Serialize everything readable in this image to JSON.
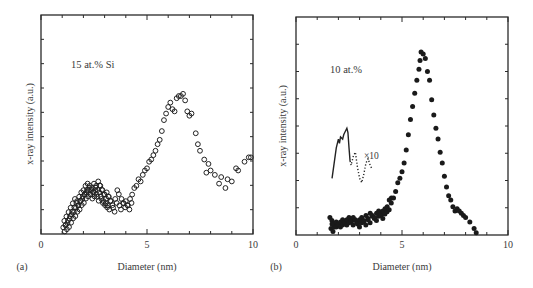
{
  "chart_data": [
    {
      "panel": "(a)",
      "type": "scatter",
      "annotation": "15 at.% Si",
      "xlabel": "Diameter (nm)",
      "ylabel": "x-ray intensity (a.u.)",
      "xlim": [
        0,
        10
      ],
      "ylim": [
        0,
        1
      ],
      "xticks": [
        0,
        5,
        10
      ],
      "marker": "open-circle",
      "grid": false,
      "series": [
        {
          "name": "15 at.% Si",
          "x": [
            1.05,
            1.1,
            1.15,
            1.2,
            1.25,
            1.3,
            1.35,
            1.4,
            1.45,
            1.5,
            1.55,
            1.6,
            1.65,
            1.7,
            1.75,
            1.8,
            1.85,
            1.9,
            1.95,
            2.0,
            2.05,
            2.1,
            2.15,
            2.2,
            2.25,
            2.3,
            2.35,
            2.4,
            2.45,
            2.5,
            2.55,
            2.6,
            2.65,
            2.7,
            2.75,
            2.8,
            2.85,
            2.9,
            2.95,
            3.0,
            3.05,
            3.1,
            3.15,
            3.2,
            3.3,
            3.4,
            3.5,
            3.6,
            3.7,
            3.8,
            3.9,
            4.0,
            4.1,
            4.2,
            4.3,
            4.4,
            4.5,
            4.6,
            4.7,
            4.8,
            4.9,
            5.0,
            5.1,
            5.2,
            5.3,
            5.4,
            5.5,
            5.6,
            5.7,
            5.8,
            5.9,
            6.0,
            6.1,
            6.2,
            6.3,
            6.4,
            6.5,
            6.6,
            6.7,
            6.8,
            6.9,
            7.0,
            7.1,
            7.3,
            7.4,
            7.5,
            7.7,
            7.8,
            7.9,
            8.0,
            8.2,
            8.4,
            8.5,
            8.7,
            8.8,
            9.0,
            9.2,
            9.3,
            9.6,
            9.8,
            9.9
          ],
          "y": [
            0.03,
            0.06,
            0.04,
            0.08,
            0.05,
            0.1,
            0.07,
            0.12,
            0.09,
            0.14,
            0.1,
            0.16,
            0.12,
            0.15,
            0.13,
            0.17,
            0.15,
            0.19,
            0.16,
            0.2,
            0.18,
            0.22,
            0.19,
            0.23,
            0.2,
            0.22,
            0.18,
            0.21,
            0.19,
            0.23,
            0.2,
            0.22,
            0.17,
            0.24,
            0.19,
            0.22,
            0.16,
            0.2,
            0.15,
            0.18,
            0.14,
            0.19,
            0.13,
            0.17,
            0.15,
            0.12,
            0.16,
            0.2,
            0.13,
            0.16,
            0.14,
            0.15,
            0.13,
            0.16,
            0.18,
            0.21,
            0.22,
            0.25,
            0.24,
            0.27,
            0.29,
            0.3,
            0.33,
            0.34,
            0.36,
            0.38,
            0.41,
            0.43,
            0.47,
            0.52,
            0.55,
            0.58,
            0.6,
            0.57,
            0.56,
            0.62,
            0.63,
            0.63,
            0.64,
            0.61,
            0.56,
            0.54,
            0.55,
            0.46,
            0.41,
            0.38,
            0.34,
            0.28,
            0.32,
            0.29,
            0.27,
            0.23,
            0.26,
            0.21,
            0.25,
            0.24,
            0.3,
            0.29,
            0.33,
            0.35,
            0.35
          ]
        }
      ]
    },
    {
      "panel": "(b)",
      "type": "scatter",
      "annotation": "10 at.%",
      "inset_annotation": "×10",
      "xlabel": "Diameter (nm)",
      "ylabel": "x-ray intensity (a.u.)",
      "xlim": [
        0,
        10
      ],
      "ylim": [
        0,
        1
      ],
      "xticks": [
        0,
        5,
        10
      ],
      "marker": "filled-circle",
      "grid": false,
      "series": [
        {
          "name": "10 at.%",
          "x": [
            1.6,
            1.65,
            1.7,
            1.8,
            1.9,
            2.0,
            2.1,
            2.2,
            2.3,
            2.4,
            2.5,
            2.6,
            2.7,
            2.8,
            2.9,
            3.0,
            3.1,
            3.2,
            3.3,
            3.4,
            3.5,
            3.6,
            3.7,
            3.8,
            3.9,
            4.0,
            4.1,
            4.2,
            4.3,
            4.4,
            4.5,
            4.6,
            4.7,
            4.8,
            4.9,
            5.0,
            5.1,
            5.2,
            5.3,
            5.4,
            5.5,
            5.6,
            5.7,
            5.8,
            5.85,
            5.9,
            6.0,
            6.1,
            6.2,
            6.3,
            6.4,
            6.5,
            6.6,
            6.7,
            6.8,
            6.9,
            7.0,
            7.1,
            7.2,
            7.3,
            7.4,
            7.5,
            7.6,
            7.7,
            7.8,
            7.9,
            8.0,
            8.2,
            8.4,
            8.5
          ],
          "y": [
            0.08,
            0.03,
            0.05,
            0.05,
            0.06,
            0.05,
            0.06,
            0.07,
            0.06,
            0.07,
            0.08,
            0.06,
            0.08,
            0.07,
            0.05,
            0.07,
            0.08,
            0.06,
            0.09,
            0.07,
            0.1,
            0.09,
            0.08,
            0.1,
            0.11,
            0.09,
            0.11,
            0.12,
            0.13,
            0.16,
            0.17,
            0.17,
            0.2,
            0.24,
            0.26,
            0.29,
            0.33,
            0.39,
            0.46,
            0.53,
            0.59,
            0.65,
            0.71,
            0.76,
            0.8,
            0.84,
            0.83,
            0.81,
            0.75,
            0.71,
            0.62,
            0.55,
            0.49,
            0.44,
            0.38,
            0.33,
            0.27,
            0.22,
            0.18,
            0.16,
            0.13,
            0.11,
            0.12,
            0.11,
            0.1,
            0.09,
            0.08,
            0.06,
            0.03,
            0.01
          ]
        },
        {
          "name": "×10 inset",
          "style": "line-solid-then-dotted",
          "x": [
            1.7,
            1.8,
            1.9,
            2.0,
            2.05,
            2.1,
            2.2,
            2.25,
            2.3,
            2.4,
            2.45,
            2.5,
            2.55,
            2.6,
            2.7,
            2.8,
            2.9,
            3.0,
            3.1,
            3.2,
            3.3,
            3.4,
            3.5,
            3.6
          ],
          "y": [
            0.26,
            0.33,
            0.4,
            0.44,
            0.42,
            0.45,
            0.44,
            0.46,
            0.47,
            0.49,
            0.47,
            0.4,
            0.34,
            0.32,
            0.36,
            0.38,
            0.31,
            0.26,
            0.24,
            0.28,
            0.33,
            0.35,
            0.32,
            0.3
          ]
        }
      ]
    }
  ],
  "panels": {
    "a": {
      "label": "(a)",
      "annotation": "15 at.% Si",
      "xlabel": "Diameter (nm)",
      "ylabel": "x-ray intensity (a.u.)",
      "tick_labels": [
        "0",
        "5",
        "10"
      ]
    },
    "b": {
      "label": "(b)",
      "annotation": "10 at.%",
      "inset_label": "×10",
      "xlabel": "Diameter (nm)",
      "ylabel": "x-ray intensity (a.u.)",
      "tick_labels": [
        "0",
        "5",
        "10"
      ]
    }
  },
  "colors": {
    "axis": "#2a2a2a",
    "marker": "#222222",
    "text": "#3a3a3a",
    "background": "#ffffff"
  }
}
